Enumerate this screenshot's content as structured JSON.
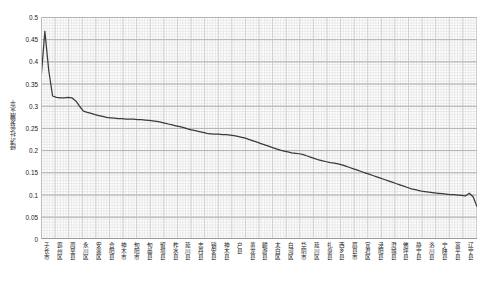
{
  "chart_data": {
    "type": "line",
    "title": "",
    "xlabel": "",
    "ylabel": "经济社会发展水平",
    "ylim": [
      0,
      0.5
    ],
    "ytick_labels": [
      "0",
      "0.05",
      "0.1",
      "0.15",
      "0.2",
      "0.25",
      "0.3",
      "0.35",
      "0.4",
      "0.45",
      "0.5"
    ],
    "ytick_values": [
      0,
      0.05,
      0.1,
      0.15,
      0.2,
      0.25,
      0.3,
      0.35,
      0.4,
      0.45,
      0.5
    ],
    "grid": true,
    "legend": false,
    "line_color": "#3a3a3a",
    "categories": [
      "子长市",
      "霸州区",
      "周至县",
      "永川区",
      "安塞区",
      "合阳县",
      "神木市",
      "旬阳市",
      "旬邑县",
      "留坝县",
      "柞水县",
      "延川县",
      "志丹县",
      "镇安县",
      "神木县",
      "户县",
      "黄龙县",
      "麟游县",
      "太白区",
      "白河区",
      "华阴市",
      "延川区",
      "礼泉县",
      "西乡县",
      "眉县市",
      "宜君区",
      "泾阳县",
      "澄城县",
      "佛坪县",
      "静宁县",
      "洛川县",
      "宁陕县",
      "富平县",
      "辽宁县"
    ],
    "values": [
      0.36,
      0.468,
      0.319,
      0.318,
      0.316,
      0.31,
      0.286,
      0.279,
      0.275,
      0.272,
      0.27,
      0.269,
      0.268,
      0.264,
      0.261,
      0.258,
      0.254,
      0.249,
      0.243,
      0.238,
      0.236,
      0.235,
      0.23,
      0.224,
      0.214,
      0.207,
      0.197,
      0.188,
      0.179,
      0.173,
      0.17,
      0.16,
      0.152,
      0.145
    ],
    "series": [
      {
        "name": "经济社会发展水平",
        "values": [
          0.36,
          0.468,
          0.319,
          0.318,
          0.316,
          0.31,
          0.286,
          0.279,
          0.275,
          0.272,
          0.27,
          0.269,
          0.268,
          0.264,
          0.261,
          0.258,
          0.254,
          0.249,
          0.243,
          0.238,
          0.236,
          0.235,
          0.23,
          0.224,
          0.214,
          0.207,
          0.197,
          0.188,
          0.179,
          0.173,
          0.17,
          0.16,
          0.152,
          0.145
        ]
      }
    ],
    "dense_points": [
      0.36,
      0.468,
      0.38,
      0.322,
      0.319,
      0.318,
      0.318,
      0.319,
      0.318,
      0.311,
      0.299,
      0.288,
      0.285,
      0.283,
      0.28,
      0.278,
      0.276,
      0.274,
      0.273,
      0.272,
      0.271,
      0.271,
      0.27,
      0.27,
      0.27,
      0.269,
      0.269,
      0.268,
      0.267,
      0.266,
      0.265,
      0.263,
      0.261,
      0.259,
      0.257,
      0.255,
      0.253,
      0.251,
      0.248,
      0.246,
      0.244,
      0.242,
      0.24,
      0.238,
      0.237,
      0.236,
      0.236,
      0.235,
      0.235,
      0.234,
      0.233,
      0.231,
      0.229,
      0.227,
      0.224,
      0.221,
      0.218,
      0.215,
      0.212,
      0.209,
      0.206,
      0.203,
      0.2,
      0.198,
      0.196,
      0.194,
      0.193,
      0.192,
      0.19,
      0.187,
      0.184,
      0.181,
      0.178,
      0.176,
      0.174,
      0.172,
      0.171,
      0.169,
      0.167,
      0.164,
      0.161,
      0.158,
      0.155,
      0.152,
      0.149,
      0.146,
      0.143,
      0.14,
      0.137,
      0.134,
      0.131,
      0.128,
      0.125,
      0.122,
      0.119,
      0.116,
      0.113,
      0.111,
      0.109,
      0.107,
      0.106,
      0.105,
      0.104,
      0.103,
      0.102,
      0.101,
      0.1,
      0.1,
      0.099,
      0.098,
      0.097,
      0.103,
      0.095,
      0.073
    ]
  }
}
